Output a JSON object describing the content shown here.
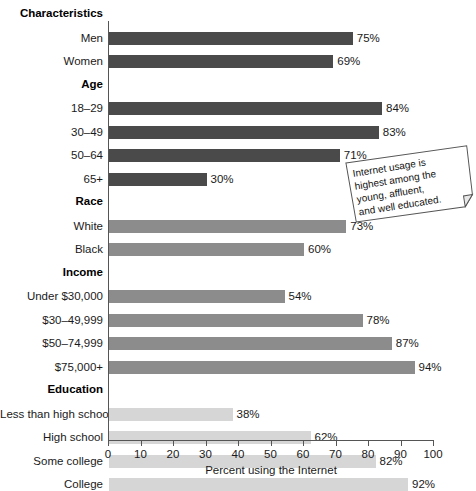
{
  "chart_data": {
    "type": "bar",
    "orientation": "horizontal",
    "title": "Characteristics",
    "xlabel": "Percent using the Internet",
    "ylabel": "",
    "xlim": [
      0,
      100
    ],
    "xticks": [
      0,
      10,
      20,
      30,
      40,
      50,
      60,
      70,
      80,
      90,
      100
    ],
    "grid": false,
    "legend": "none",
    "value_suffix": "%",
    "groups": [
      {
        "name": "",
        "color": "#4a4a4a",
        "categories": [
          "Men",
          "Women"
        ],
        "values": [
          75,
          69
        ],
        "labels": [
          "75%",
          "69%"
        ]
      },
      {
        "name": "Age",
        "color": "#4a4a4a",
        "categories": [
          "18–29",
          "30–49",
          "50–64",
          "65+"
        ],
        "values": [
          84,
          83,
          71,
          30
        ],
        "labels": [
          "84%",
          "83%",
          "71%",
          "30%"
        ]
      },
      {
        "name": "Race",
        "color": "#8c8c8c",
        "categories": [
          "White",
          "Black"
        ],
        "values": [
          73,
          60
        ],
        "labels": [
          "73%",
          "60%"
        ]
      },
      {
        "name": "Income",
        "color": "#8c8c8c",
        "categories": [
          "Under $30,000",
          "$30–49,999",
          "$50–74,999",
          "$75,000+"
        ],
        "values": [
          54,
          78,
          87,
          94
        ],
        "labels": [
          "54%",
          "78%",
          "87%",
          "94%"
        ]
      },
      {
        "name": "Education",
        "color": "#d6d6d6",
        "categories": [
          "Less than high school",
          "High school",
          "Some college",
          "College"
        ],
        "values": [
          38,
          62,
          82,
          92
        ],
        "labels": [
          "38%",
          "62%",
          "82%",
          "92%"
        ]
      }
    ],
    "annotations": [
      {
        "id": "callout-note",
        "text": "Internet usage is highest among the young, affluent, and well educated."
      }
    ]
  },
  "callout": {
    "line1": "Internet usage is",
    "line2": "highest among the",
    "line3": "young, affluent,",
    "line4": "and well educated."
  }
}
